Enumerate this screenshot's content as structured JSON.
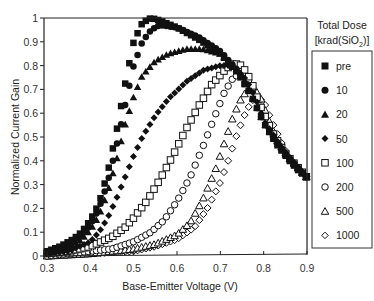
{
  "chart_data": {
    "type": "scatter",
    "title": "",
    "xlabel": "Base-Emitter Voltage (V)",
    "ylabel": "Normalized Current Gain",
    "xlim": [
      0.3,
      0.9
    ],
    "ylim": [
      0,
      1
    ],
    "xticks": [
      "0.3",
      "0.4",
      "0.5",
      "0.6",
      "0.7",
      "0.8",
      "0.9"
    ],
    "yticks": [
      "0",
      "0.1",
      "0.2",
      "0.3",
      "0.4",
      "0.5",
      "0.6",
      "0.7",
      "0.8",
      "0.9",
      "1"
    ],
    "grid": false,
    "legend": {
      "title_line1": "Total Dose",
      "title_line2": "[krad(SiO",
      "title_sub": "2",
      "title_end": ")]",
      "position": "right"
    },
    "series": [
      {
        "name": "pre",
        "marker": "square-filled",
        "x": [
          0.3,
          0.33,
          0.36,
          0.38,
          0.4,
          0.42,
          0.44,
          0.46,
          0.48,
          0.5,
          0.52,
          0.54,
          0.56,
          0.6,
          0.65,
          0.7,
          0.74,
          0.77,
          0.8,
          0.83,
          0.86,
          0.88,
          0.9
        ],
        "y": [
          0.02,
          0.04,
          0.07,
          0.1,
          0.15,
          0.22,
          0.35,
          0.52,
          0.72,
          0.9,
          0.98,
          1.0,
          0.99,
          0.96,
          0.91,
          0.85,
          0.77,
          0.68,
          0.56,
          0.47,
          0.4,
          0.36,
          0.33
        ]
      },
      {
        "name": "10",
        "marker": "circle-filled",
        "x": [
          0.3,
          0.34,
          0.38,
          0.4,
          0.42,
          0.44,
          0.46,
          0.48,
          0.5,
          0.52,
          0.54,
          0.56,
          0.6,
          0.65,
          0.7,
          0.74,
          0.77,
          0.8,
          0.84,
          0.88,
          0.9
        ],
        "y": [
          0.01,
          0.04,
          0.09,
          0.13,
          0.2,
          0.31,
          0.46,
          0.63,
          0.8,
          0.9,
          0.95,
          0.97,
          0.96,
          0.92,
          0.86,
          0.78,
          0.68,
          0.56,
          0.45,
          0.37,
          0.33
        ]
      },
      {
        "name": "20",
        "marker": "triangle-filled",
        "x": [
          0.3,
          0.34,
          0.38,
          0.4,
          0.42,
          0.44,
          0.46,
          0.48,
          0.5,
          0.52,
          0.55,
          0.58,
          0.62,
          0.66,
          0.7,
          0.74,
          0.77,
          0.8,
          0.84,
          0.88,
          0.9
        ],
        "y": [
          0.01,
          0.03,
          0.07,
          0.11,
          0.17,
          0.27,
          0.4,
          0.55,
          0.67,
          0.76,
          0.82,
          0.85,
          0.87,
          0.87,
          0.85,
          0.78,
          0.68,
          0.56,
          0.45,
          0.37,
          0.33
        ]
      },
      {
        "name": "50",
        "marker": "diamond-filled",
        "x": [
          0.3,
          0.35,
          0.4,
          0.42,
          0.44,
          0.46,
          0.48,
          0.5,
          0.52,
          0.55,
          0.58,
          0.62,
          0.66,
          0.7,
          0.73,
          0.76,
          0.78,
          0.8,
          0.84,
          0.88,
          0.9
        ],
        "y": [
          0.01,
          0.02,
          0.06,
          0.1,
          0.16,
          0.24,
          0.33,
          0.42,
          0.5,
          0.59,
          0.66,
          0.73,
          0.78,
          0.8,
          0.8,
          0.74,
          0.67,
          0.57,
          0.46,
          0.37,
          0.33
        ]
      },
      {
        "name": "100",
        "marker": "square-open",
        "x": [
          0.3,
          0.35,
          0.4,
          0.45,
          0.48,
          0.5,
          0.53,
          0.56,
          0.59,
          0.62,
          0.65,
          0.68,
          0.71,
          0.73,
          0.75,
          0.77,
          0.79,
          0.82,
          0.85,
          0.88,
          0.9
        ],
        "y": [
          0.01,
          0.02,
          0.04,
          0.08,
          0.12,
          0.16,
          0.23,
          0.32,
          0.42,
          0.53,
          0.63,
          0.72,
          0.78,
          0.81,
          0.8,
          0.74,
          0.64,
          0.52,
          0.43,
          0.37,
          0.33
        ]
      },
      {
        "name": "200",
        "marker": "circle-open",
        "x": [
          0.3,
          0.4,
          0.45,
          0.5,
          0.54,
          0.57,
          0.6,
          0.63,
          0.66,
          0.69,
          0.71,
          0.73,
          0.75,
          0.77,
          0.79,
          0.82,
          0.85,
          0.88,
          0.9
        ],
        "y": [
          0.0,
          0.02,
          0.03,
          0.06,
          0.1,
          0.15,
          0.23,
          0.33,
          0.46,
          0.6,
          0.69,
          0.75,
          0.77,
          0.73,
          0.64,
          0.52,
          0.43,
          0.37,
          0.33
        ]
      },
      {
        "name": "500",
        "marker": "triangle-open",
        "x": [
          0.3,
          0.4,
          0.5,
          0.55,
          0.6,
          0.63,
          0.66,
          0.69,
          0.71,
          0.73,
          0.75,
          0.77,
          0.79,
          0.81,
          0.83,
          0.86,
          0.88,
          0.9
        ],
        "y": [
          0.0,
          0.01,
          0.03,
          0.05,
          0.09,
          0.14,
          0.24,
          0.37,
          0.48,
          0.59,
          0.67,
          0.71,
          0.68,
          0.58,
          0.49,
          0.41,
          0.37,
          0.33
        ]
      },
      {
        "name": "1000",
        "marker": "diamond-open",
        "x": [
          0.3,
          0.4,
          0.5,
          0.55,
          0.6,
          0.64,
          0.67,
          0.7,
          0.72,
          0.74,
          0.76,
          0.78,
          0.8,
          0.82,
          0.84,
          0.86,
          0.88,
          0.9
        ],
        "y": [
          0.0,
          0.01,
          0.02,
          0.04,
          0.07,
          0.12,
          0.2,
          0.31,
          0.41,
          0.52,
          0.61,
          0.67,
          0.65,
          0.56,
          0.48,
          0.41,
          0.37,
          0.33
        ]
      }
    ]
  }
}
